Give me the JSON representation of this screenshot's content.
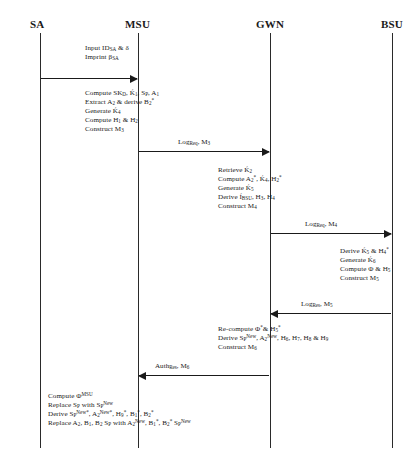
{
  "diagram": {
    "type": "uml-sequence-diagram",
    "lifelines": [
      {
        "id": "sa",
        "label": "SA",
        "x": 14
      },
      {
        "id": "msu",
        "label": "MSU",
        "x": 138
      },
      {
        "id": "gwn",
        "label": "GWN",
        "x": 270
      },
      {
        "id": "bsu",
        "label": "BSU",
        "x": 392
      }
    ],
    "notes": [
      {
        "id": "note-sa-input",
        "owner": "sa",
        "lines": [
          "Input ID<sub>SA</sub> &amp; δ",
          "Imprint β<sub>SA</sub>"
        ]
      },
      {
        "id": "note-msu-compute",
        "owner": "msu",
        "lines": [
          "Compute SK<sub>D</sub>, Ḱ<sub>1</sub>, S<sub>P</sub>, A<sub>1</sub>",
          "Extract A<sub>2</sub> &amp; derive B<sub>2</sub><sup>*</sup>",
          "Generate Ḱ<sub>4</sub>",
          "Compute H<sub>1</sub> &amp; H<sub>2</sub>",
          "Construct M<sub>3</sub>"
        ]
      },
      {
        "id": "note-gwn-verify",
        "owner": "gwn",
        "lines": [
          "Retrieve Ḱ<sub>2</sub>",
          "Compute  A<sub>2</sub><sup>*</sup>, Ḱ<sub>4</sub>, H<sub>2</sub><sup>*</sup>",
          "Generate Ḱ<sub>5</sub>",
          "Derive Í<sub>BSU</sub>, H<sub>3</sub>, H<sub>4</sub>",
          "Construct M<sub>4</sub>"
        ]
      },
      {
        "id": "note-bsu-derive",
        "owner": "bsu",
        "lines": [
          "Derive Ḱ<sub>5</sub> &amp;  H<sub>4</sub><sup>*</sup>",
          "Generate Ḱ<sub>6</sub>",
          "Compute Φ &amp; H<sub>5</sub>",
          "Construct M<sub>5</sub>"
        ]
      },
      {
        "id": "note-gwn-recompute",
        "owner": "gwn",
        "lines": [
          "Re-compute Φ<sup>*</sup>&amp; H<sub>5</sub><sup>*</sup>",
          "Derive S<sub>P</sub><sup>New</sup>, A<sub>2</sub><sup>New</sup>, H<sub>6</sub>,  H<sub>7</sub>, H<sub>8</sub> &amp; H<sub>9</sub>",
          "Construct M<sub>6</sub>"
        ]
      },
      {
        "id": "note-msu-final",
        "owner": "msu",
        "lines": [
          "Compute Φ<sup>MSU</sup>",
          "Replace S<sub>P</sub> with S<sub>P</sub><sup>New</sup>",
          "Derive S<sub>P</sub><sup>New*</sup>, A<sub>2</sub><sup>New*</sup>, H<sub>9</sub><sup>*</sup>, B<sub>1</sub><sup>*</sup>, B<sub>2</sub><sup>*</sup>",
          "Replace A<sub>2</sub>, B<sub>1</sub>, B<sub>2</sub> S<sub>P</sub> with A<sub>2</sub><sup>New</sup>, B<sub>1</sub><sup>*</sup>, B<sub>2</sub><sup>*</sup>  S<sub>P</sub><sup>New</sup>"
        ]
      }
    ],
    "messages": [
      {
        "id": "msg-sa-msu",
        "from": "sa",
        "to": "msu",
        "label": ""
      },
      {
        "id": "msg-msu-gwn",
        "from": "msu",
        "to": "gwn",
        "label": "Log<sub>Req</sub>,  M<sub>3</sub>"
      },
      {
        "id": "msg-gwn-bsu",
        "from": "gwn",
        "to": "bsu",
        "label": "Log<sub>Req</sub>,  M<sub>4</sub>"
      },
      {
        "id": "msg-bsu-gwn",
        "from": "bsu",
        "to": "gwn",
        "label": "Log<sub>Res</sub>,  M<sub>5</sub>"
      },
      {
        "id": "msg-gwn-msu",
        "from": "gwn",
        "to": "msu",
        "label": "Auth<sub>Res</sub>,  M<sub>6</sub>"
      }
    ],
    "colors": {
      "line": "#2a2a2a",
      "text": "#1a1a1a",
      "background": "#ffffff"
    }
  }
}
